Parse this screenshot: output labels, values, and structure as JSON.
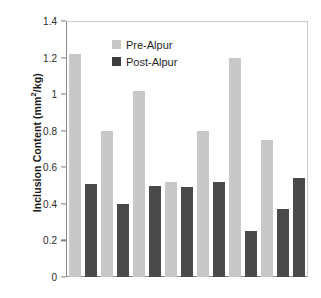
{
  "chart_data": {
    "type": "bar",
    "title": "",
    "xlabel": "",
    "ylabel": "Inclusion Content (mm²/kg)",
    "ylim": [
      0,
      1.4
    ],
    "ytick_labels": [
      "0",
      "0.2",
      "0.4",
      "0.6",
      "0.8",
      "1",
      "1.2",
      "1.4"
    ],
    "ytick_values": [
      0,
      0.2,
      0.4,
      0.6,
      0.8,
      1,
      1.2,
      1.4
    ],
    "xtick_labels": [],
    "grid": false,
    "legend_position": "upper-left-inside",
    "categories": [
      "1",
      "2",
      "3",
      "4",
      "5",
      "6",
      "7"
    ],
    "series": [
      {
        "name": "Pre-Alpur",
        "color": "#c8c8c8",
        "values": [
          1.22,
          0.8,
          1.02,
          0.52,
          0.8,
          1.2,
          0.75
        ]
      },
      {
        "name": "Post-Alpur",
        "color": "#4a4a4a",
        "values": [
          0.51,
          0.4,
          0.5,
          0.49,
          0.52,
          0.25,
          0.37
        ]
      }
    ],
    "extra_bars": [
      {
        "series": "Post-Alpur",
        "value": 0.54
      }
    ]
  },
  "legend": {
    "items": [
      {
        "label": "Pre-Alpur",
        "swatch": "pre"
      },
      {
        "label": "Post-Alpur",
        "swatch": "post"
      }
    ]
  },
  "axis": {
    "y_label_prefix": "Inclusion Content (mm",
    "y_label_sup": "2",
    "y_label_suffix": "/kg)"
  }
}
